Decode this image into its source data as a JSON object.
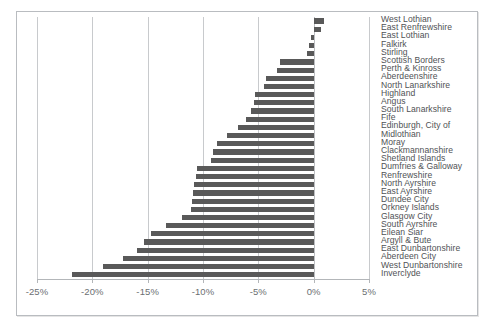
{
  "chart": {
    "type": "bar",
    "orientation": "horizontal",
    "bar_color": "#595959",
    "gridline_color": "#c8cacd",
    "background": "#ffffff",
    "border_color": "#b9bcc0"
  },
  "axis": {
    "ticks": [
      "-25%",
      "-20%",
      "-15%",
      "-10%",
      "-5%",
      "0%",
      "5%"
    ],
    "tick_values": [
      -25,
      -20,
      -15,
      -10,
      -5,
      0,
      5
    ],
    "min": -25,
    "max": 5,
    "step": 5
  },
  "chart_data": {
    "type": "bar",
    "title": "",
    "subtitle": "",
    "xlabel": "",
    "ylabel": "",
    "xlim": [
      -25,
      5
    ],
    "grid": true,
    "legend": false,
    "orientation": "horizontal",
    "categories": [
      "West Lothian",
      "East Renfrewshire",
      "East Lothian",
      "Falkirk",
      "Stirling",
      "Scottish Borders",
      "Perth & Kinross",
      "Aberdeenshire",
      "North Lanarkshire",
      "Highland",
      "Angus",
      "South Lanarkshire",
      "Fife",
      "Edinburgh, City of",
      "Midlothian",
      "Moray",
      "Clackmannanshire",
      "Shetland Islands",
      "Dumfries & Galloway",
      "Renfrewshire",
      "North Ayrshire",
      "East Ayrshire",
      "Dundee City",
      "Orkney Islands",
      "Glasgow City",
      "South Ayrshire",
      "Eilean Siar",
      "Argyll & Bute",
      "East Dunbartonshire",
      "Aberdeen City",
      "West Dunbartonshire",
      "Inverclyde"
    ],
    "values": [
      0.9,
      0.7,
      -0.2,
      -0.4,
      -0.6,
      -3.0,
      -3.3,
      -4.3,
      -4.5,
      -5.3,
      -5.4,
      -5.7,
      -6.1,
      -6.8,
      -7.8,
      -8.7,
      -9.1,
      -9.3,
      -10.5,
      -10.6,
      -10.8,
      -10.9,
      -11.0,
      -11.1,
      -11.9,
      -13.3,
      -14.7,
      -15.3,
      -16.0,
      -17.2,
      -19.0,
      -21.8
    ]
  }
}
